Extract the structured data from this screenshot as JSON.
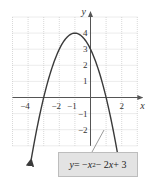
{
  "chart_data": {
    "type": "line",
    "title": "",
    "equation": "y = -x^2 - 2x + 3",
    "xlabel": "x",
    "ylabel": "y",
    "xlim": [
      -5,
      3
    ],
    "ylim": [
      -3,
      5
    ],
    "grid": true,
    "x_tick_labels": [
      "-4",
      "-2",
      "-1",
      "2"
    ],
    "y_tick_labels": [
      "4",
      "3",
      "2",
      "1",
      "-1",
      "-2"
    ],
    "series": [
      {
        "name": "y = -x^2 - 2x + 3",
        "x": [
          -3.8,
          -3.5,
          -3,
          -2.5,
          -2,
          -1.5,
          -1,
          -0.5,
          0,
          0.5,
          1,
          1.5,
          1.8
        ],
        "y": [
          -3.84,
          -1.25,
          0,
          1.75,
          3,
          3.75,
          4,
          3.75,
          3,
          1.75,
          0,
          -1.25,
          -3.84
        ]
      }
    ],
    "annotations": [
      {
        "text": "y = -x^2 - 2x + 3",
        "type": "callout",
        "position": "bottom-right"
      }
    ],
    "key_points": {
      "vertex": [
        -1,
        4
      ],
      "y_intercept": [
        0,
        3
      ],
      "x_intercepts": [
        [
          -3,
          0
        ],
        [
          1,
          0
        ]
      ]
    }
  },
  "labels": {
    "x_axis": "x",
    "y_axis": "y",
    "eq_y": "y",
    "eq_eq": " = −",
    "eq_x": "x",
    "eq_sup": "2",
    "eq_mid": " − 2",
    "eq_x2": "x",
    "eq_end": " + 3"
  },
  "colors": {
    "curve": "#3a3a3a",
    "grid": "#c8c8c8",
    "axis": "#555555",
    "callout_bg": "#e3e3e3"
  }
}
